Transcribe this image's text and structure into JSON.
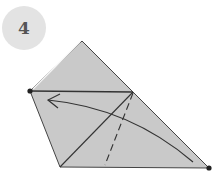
{
  "step": {
    "number": "4"
  },
  "colors": {
    "paper": "#c9c9c9",
    "line": "#333333",
    "badge": "#e3e3e3"
  },
  "diagram": {
    "points": {
      "left_dot": [
        30,
        91
      ],
      "right_dot": [
        209,
        168
      ]
    }
  }
}
